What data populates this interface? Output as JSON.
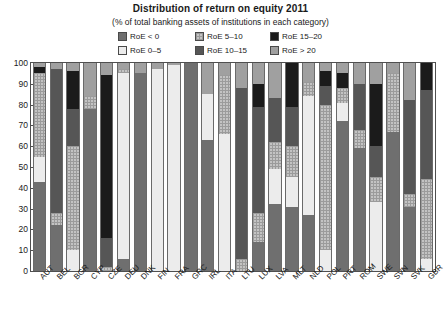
{
  "chart": {
    "title": "Distribution of return on equity 2011",
    "subtitle": "(% of total banking assets of institutions in each category)"
  },
  "legend": {
    "items": [
      {
        "label": "RoE < 0",
        "key": "neg",
        "color": "#6f6f6f"
      },
      {
        "label": "RoE 0–5",
        "key": "0-5",
        "color": "#ececec"
      },
      {
        "label": "RoE 5–10",
        "key": "5-10",
        "color": "#c3c3c3"
      },
      {
        "label": "RoE 10–15",
        "key": "10-15",
        "color": "#565656"
      },
      {
        "label": "RoE 15–20",
        "key": "15-20",
        "color": "#1b1b1b"
      },
      {
        "label": "RoE > 20",
        "key": "gt20",
        "color": "#a0a0a0"
      }
    ]
  },
  "chart_data": {
    "type": "bar",
    "subtype": "stacked-vertical-100pct",
    "title": "Distribution of return on equity 2011",
    "subtitle": "(% of total banking assets of institutions in each category)",
    "xlabel": "",
    "ylabel": "",
    "ylim": [
      0,
      100
    ],
    "yticks": [
      0,
      10,
      20,
      30,
      40,
      50,
      60,
      70,
      80,
      90,
      100
    ],
    "grid": false,
    "legend_position": "top-center",
    "categories": [
      "AUT",
      "BEL",
      "BGR",
      "CYP",
      "CZE",
      "DEU",
      "DNK",
      "FIN",
      "FRA",
      "GRC",
      "IRL",
      "ITA",
      "LTU",
      "LUX",
      "LVA",
      "MLT",
      "NLD",
      "POL",
      "PRT",
      "ROM",
      "SWE",
      "SVN",
      "SVK",
      "GBR"
    ],
    "series": [
      {
        "name": "RoE < 0",
        "key": "neg",
        "values": [
          43,
          22,
          0,
          78,
          0,
          6,
          95,
          0,
          0,
          100,
          63,
          0,
          0,
          14,
          32,
          31,
          27,
          0,
          72,
          59,
          0,
          67,
          31,
          0
        ]
      },
      {
        "name": "RoE 0–5",
        "key": "0-5",
        "values": [
          12,
          0,
          10,
          0,
          0,
          89,
          0,
          97,
          99,
          0,
          22,
          66,
          0,
          0,
          17,
          14,
          57,
          10,
          9,
          0,
          33,
          0,
          0,
          6
        ]
      },
      {
        "name": "RoE 5–10",
        "key": "5-10",
        "values": [
          40,
          6,
          50,
          6,
          2,
          2,
          0,
          0,
          0,
          0,
          0,
          28,
          6,
          14,
          13,
          15,
          7,
          70,
          7,
          9,
          12,
          28,
          6,
          38
        ]
      },
      {
        "name": "RoE 10–15",
        "key": "10-15",
        "values": [
          0,
          69,
          18,
          0,
          14,
          0,
          0,
          0,
          0,
          0,
          0,
          0,
          82,
          51,
          21,
          19,
          0,
          9,
          0,
          22,
          15,
          0,
          45,
          43
        ]
      },
      {
        "name": "RoE 15–20",
        "key": "15-20",
        "values": [
          3,
          0,
          18,
          0,
          78,
          0,
          0,
          0,
          0,
          0,
          0,
          0,
          0,
          11,
          0,
          21,
          0,
          7,
          7,
          0,
          30,
          0,
          0,
          13
        ]
      },
      {
        "name": "RoE > 20",
        "key": "gt20",
        "values": [
          2,
          3,
          4,
          16,
          6,
          3,
          5,
          3,
          1,
          0,
          15,
          6,
          12,
          10,
          17,
          0,
          9,
          4,
          5,
          10,
          10,
          5,
          18,
          0
        ]
      }
    ]
  }
}
